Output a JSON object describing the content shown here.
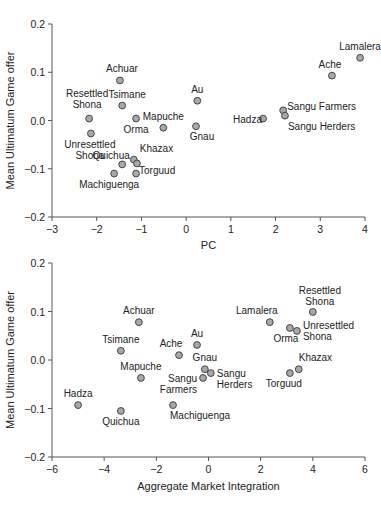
{
  "chart_data": [
    {
      "type": "scatter",
      "title": "",
      "xlabel": "PC",
      "ylabel": "Mean Ultimatum Game offer",
      "xlim": [
        -3,
        4
      ],
      "ylim": [
        -0.2,
        0.2
      ],
      "xticks": [
        -3,
        -2,
        -1,
        0,
        1,
        2,
        3,
        4
      ],
      "yticks": [
        0.2,
        0.1,
        0.0,
        -0.1,
        -0.2
      ],
      "ytick_labels": [
        "0.2",
        "0.1",
        "0.0",
        "−0.1",
        "−0.2"
      ],
      "xtick_labels": [
        "−3",
        "−2",
        "−1",
        "0",
        "1",
        "2",
        "3",
        "4"
      ],
      "grid": false,
      "points": [
        {
          "label": [
            "Lamalera"
          ],
          "x": 3.89,
          "y": 0.13,
          "lx": 0,
          "ly": -8,
          "anchor": "middle"
        },
        {
          "label": [
            "Ache"
          ],
          "x": 3.26,
          "y": 0.093,
          "lx": -2,
          "ly": -8,
          "anchor": "middle"
        },
        {
          "label": [
            "Achuar"
          ],
          "x": -1.48,
          "y": 0.083,
          "lx": 2,
          "ly": -8,
          "anchor": "middle"
        },
        {
          "label": [
            "Tsimane"
          ],
          "x": -1.43,
          "y": 0.031,
          "lx": 5,
          "ly": -8,
          "anchor": "middle"
        },
        {
          "label": [
            "Resettled",
            "Shona"
          ],
          "x": -2.17,
          "y": 0.004,
          "lx": -2,
          "ly": -22,
          "anchor": "middle"
        },
        {
          "label": [
            "Orma"
          ],
          "x": -1.12,
          "y": 0.004,
          "lx": 0,
          "ly": 14,
          "anchor": "middle"
        },
        {
          "label": [
            "Mapuche"
          ],
          "x": -0.51,
          "y": -0.015,
          "lx": 0,
          "ly": -8,
          "anchor": "middle"
        },
        {
          "label": [
            "Au"
          ],
          "x": 0.25,
          "y": 0.041,
          "lx": 0,
          "ly": -8,
          "anchor": "middle"
        },
        {
          "label": [
            "Gnau"
          ],
          "x": 0.22,
          "y": -0.012,
          "lx": 6,
          "ly": 14,
          "anchor": "middle"
        },
        {
          "label": [
            "Hadza"
          ],
          "x": 1.72,
          "y": 0.004,
          "lx": -30,
          "ly": 4,
          "anchor": "start"
        },
        {
          "label": [
            "Sangu Farmers"
          ],
          "x": 2.17,
          "y": 0.021,
          "lx": 4,
          "ly": 0,
          "anchor": "start"
        },
        {
          "label": [
            "Sangu Herders"
          ],
          "x": 2.21,
          "y": 0.01,
          "lx": 3,
          "ly": 14,
          "anchor": "start"
        },
        {
          "label": [
            "Unresettled",
            "Shona"
          ],
          "x": -2.13,
          "y": -0.027,
          "lx": -1,
          "ly": 14,
          "anchor": "middle"
        },
        {
          "label": [
            "Quichua"
          ],
          "x": -1.43,
          "y": -0.091,
          "lx": -11,
          "ly": -5,
          "anchor": "middle"
        },
        {
          "label": [
            "Khazax"
          ],
          "x": -1.17,
          "y": -0.081,
          "lx": 6,
          "ly": -8,
          "anchor": "start"
        },
        {
          "label": [
            "Torguud"
          ],
          "x": -1.12,
          "y": -0.11,
          "lx": 3,
          "ly": 0,
          "anchor": "start"
        },
        {
          "label": [
            "Machiguenga"
          ],
          "x": -1.61,
          "y": -0.11,
          "lx": -5,
          "ly": 14,
          "anchor": "middle"
        },
        {
          "label": [
            ""
          ],
          "x": -1.1,
          "y": -0.089,
          "lx": 0,
          "ly": 0,
          "anchor": "middle"
        }
      ]
    },
    {
      "type": "scatter",
      "title": "",
      "xlabel": "Aggregate Market Integration",
      "ylabel": "Mean Ultimatum Game offer",
      "xlim": [
        -6,
        6
      ],
      "ylim": [
        -0.2,
        0.2
      ],
      "xticks": [
        -6,
        -4,
        -2,
        0,
        2,
        4,
        6
      ],
      "yticks": [
        0.2,
        0.1,
        0.0,
        -0.1,
        -0.2
      ],
      "ytick_labels": [
        "0.2",
        "0.1",
        "0.0",
        "−0.1",
        "−0.2"
      ],
      "xtick_labels": [
        "−6",
        "−4",
        "−2",
        "0",
        "2",
        "4",
        "6"
      ],
      "grid": false,
      "points": [
        {
          "label": [
            "Achuar"
          ],
          "x": -2.67,
          "y": 0.078,
          "lx": 0,
          "ly": -8,
          "anchor": "middle"
        },
        {
          "label": [
            "Tsimane"
          ],
          "x": -3.36,
          "y": 0.019,
          "lx": 0,
          "ly": -8,
          "anchor": "middle"
        },
        {
          "label": [
            "Ache"
          ],
          "x": -1.13,
          "y": 0.01,
          "lx": -8,
          "ly": -8,
          "anchor": "middle"
        },
        {
          "label": [
            "Au"
          ],
          "x": -0.44,
          "y": 0.031,
          "lx": 0,
          "ly": -8,
          "anchor": "middle"
        },
        {
          "label": [
            "Mapuche"
          ],
          "x": -2.59,
          "y": -0.037,
          "lx": 0,
          "ly": -8,
          "anchor": "middle"
        },
        {
          "label": [
            "Hadza"
          ],
          "x": -5.0,
          "y": -0.093,
          "lx": 0,
          "ly": -8,
          "anchor": "middle"
        },
        {
          "label": [
            "Quichua"
          ],
          "x": -3.36,
          "y": -0.105,
          "lx": 0,
          "ly": 14,
          "anchor": "middle"
        },
        {
          "label": [
            "Machiguenga"
          ],
          "x": -1.36,
          "y": -0.093,
          "lx": -3,
          "ly": 14,
          "anchor": "start"
        },
        {
          "label": [
            "Gnau"
          ],
          "x": -0.14,
          "y": -0.019,
          "lx": 0,
          "ly": -8,
          "anchor": "middle"
        },
        {
          "label": [
            "Sangu",
            "Farmers"
          ],
          "x": -0.21,
          "y": -0.037,
          "lx": -6,
          "ly": 4,
          "anchor": "end"
        },
        {
          "label": [
            "Sangu",
            "Herders"
          ],
          "x": 0.09,
          "y": -0.027,
          "lx": 6,
          "ly": 4,
          "anchor": "start"
        },
        {
          "label": [
            "Lamalera"
          ],
          "x": 2.35,
          "y": 0.078,
          "lx": -13,
          "ly": -8,
          "anchor": "middle"
        },
        {
          "label": [
            "Orma"
          ],
          "x": 3.12,
          "y": 0.066,
          "lx": -4,
          "ly": 14,
          "anchor": "middle"
        },
        {
          "label": [
            "Unresettled",
            "Shona"
          ],
          "x": 3.39,
          "y": 0.06,
          "lx": 6,
          "ly": -2,
          "anchor": "start"
        },
        {
          "label": [
            "Resettled",
            "Shona"
          ],
          "x": 4.0,
          "y": 0.099,
          "lx": 7,
          "ly": -18,
          "anchor": "middle"
        },
        {
          "label": [
            "Khazax"
          ],
          "x": 3.46,
          "y": -0.019,
          "lx": 0,
          "ly": -8,
          "anchor": "start"
        },
        {
          "label": [
            "Torguud"
          ],
          "x": 3.12,
          "y": -0.027,
          "lx": -6,
          "ly": 14,
          "anchor": "middle"
        }
      ]
    }
  ]
}
